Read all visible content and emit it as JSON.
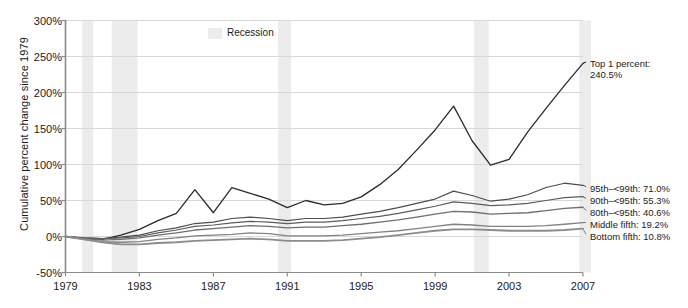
{
  "chart_data": {
    "type": "line",
    "title": "",
    "xlabel": "",
    "ylabel": "Cumulative percent change since 1979",
    "xlim": [
      1979,
      2007
    ],
    "ylim": [
      -50,
      300
    ],
    "yticks": [
      "-50%",
      "0%",
      "50%",
      "100%",
      "150%",
      "200%",
      "250%",
      "300%"
    ],
    "ytick_values": [
      -50,
      0,
      50,
      100,
      150,
      200,
      250,
      300
    ],
    "xticks": [
      "1979",
      "1983",
      "1987",
      "1991",
      "1995",
      "1999",
      "2003",
      "2007"
    ],
    "xtick_values": [
      1979,
      1983,
      1987,
      1991,
      1995,
      1999,
      2003,
      2007
    ],
    "grid": "horizontal",
    "legend_position": "right-of-plot-endpoint-labels",
    "x": [
      1979,
      1980,
      1981,
      1982,
      1983,
      1984,
      1985,
      1986,
      1987,
      1988,
      1989,
      1990,
      1991,
      1992,
      1993,
      1994,
      1995,
      1996,
      1997,
      1998,
      1999,
      2000,
      2001,
      2002,
      2003,
      2004,
      2005,
      2006,
      2007
    ],
    "series": [
      {
        "name": "Top 1 percent",
        "end_label": "Top 1 percent:",
        "end_value_label": "240.5%",
        "end_value": 240.5,
        "color": "#2b2b2b",
        "width": 1.3,
        "values": [
          0,
          -3,
          -4,
          2,
          10,
          22,
          32,
          65,
          33,
          68,
          60,
          52,
          40,
          50,
          44,
          46,
          55,
          72,
          93,
          120,
          148,
          181,
          133,
          99,
          107,
          145,
          178,
          210,
          240.5
        ]
      },
      {
        "name": "95th–<99th",
        "end_label": "95th–<99th: 71.0%",
        "end_value": 71.0,
        "color": "#4d4d4d",
        "width": 1.2,
        "values": [
          0,
          -2,
          -3,
          -1,
          2,
          8,
          12,
          18,
          20,
          25,
          27,
          25,
          22,
          25,
          25,
          27,
          31,
          35,
          40,
          46,
          52,
          63,
          57,
          49,
          52,
          58,
          68,
          74,
          71.0
        ]
      },
      {
        "name": "90th–<95th",
        "end_label": "90th–<95th: 55.3%",
        "end_value": 55.3,
        "color": "#5c5c5c",
        "width": 1.2,
        "values": [
          0,
          -2,
          -3,
          -2,
          0,
          5,
          9,
          14,
          16,
          19,
          21,
          20,
          18,
          20,
          20,
          22,
          25,
          28,
          32,
          37,
          42,
          48,
          46,
          43,
          44,
          46,
          50,
          54,
          55.3
        ]
      },
      {
        "name": "80th–<95th",
        "end_label": "80th–<95th: 40.6%",
        "end_value": 40.6,
        "color": "#6e6e6e",
        "width": 1.3,
        "values": [
          0,
          -3,
          -5,
          -4,
          -2,
          2,
          5,
          9,
          11,
          13,
          15,
          14,
          12,
          13,
          13,
          15,
          17,
          20,
          23,
          27,
          31,
          35,
          34,
          31,
          32,
          33,
          36,
          39,
          40.6
        ]
      },
      {
        "name": "Middle fifth",
        "end_label": "Middle fifth: 19.2%",
        "end_value": 19.2,
        "color": "#828282",
        "width": 1.3,
        "values": [
          0,
          -4,
          -7,
          -8,
          -7,
          -4,
          -2,
          1,
          2,
          3,
          5,
          4,
          1,
          1,
          1,
          2,
          4,
          6,
          8,
          11,
          14,
          17,
          16,
          14,
          14,
          14,
          15,
          17,
          19.2
        ]
      },
      {
        "name": "Bottom fifth",
        "end_label": "Bottom fifth: 10.8%",
        "end_value": 10.8,
        "color": "#8c8c8c",
        "width": 1.8,
        "values": [
          0,
          -4,
          -8,
          -11,
          -11,
          -9,
          -8,
          -6,
          -5,
          -4,
          -3,
          -4,
          -6,
          -6,
          -6,
          -5,
          -3,
          -1,
          2,
          5,
          8,
          10,
          10,
          9,
          8,
          8,
          8,
          9,
          10.8
        ]
      }
    ],
    "recessions": [
      {
        "start": 1979.9,
        "end": 1980.5
      },
      {
        "start": 1981.5,
        "end": 1982.9
      },
      {
        "start": 1990.5,
        "end": 1991.2
      },
      {
        "start": 2001.1,
        "end": 2001.9
      },
      {
        "start": 2006.8,
        "end": 2007.5
      }
    ],
    "recession_color": "#ececec",
    "gridline_color": "#d8d8d8",
    "axis_color": "#8a8a8a",
    "legend": {
      "label": "Recession",
      "swatch_color": "#ececec"
    }
  }
}
